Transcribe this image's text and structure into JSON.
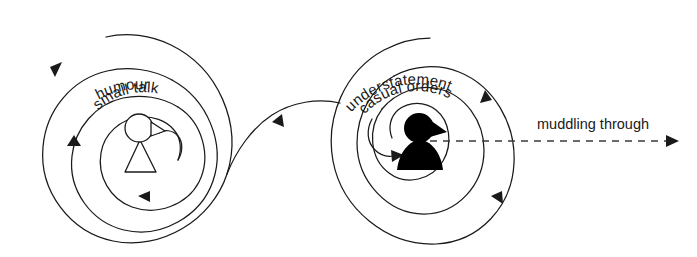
{
  "diagram": {
    "background_color": "#ffffff",
    "stroke_color": "#1a1a1a",
    "dash_color": "#3a3a3a"
  },
  "left_spiral": {
    "name": "left-spiral",
    "direction": "counterclockwise",
    "center_figure": "outlined person icon",
    "labels": [
      {
        "text": "humour",
        "ring": "outer"
      },
      {
        "text": "small talk",
        "ring": "middle"
      }
    ]
  },
  "right_spiral": {
    "name": "right-spiral",
    "direction": "clockwise",
    "center_figure": "filled black person icon",
    "labels": [
      {
        "text": "understatement",
        "ring": "outer"
      },
      {
        "text": "casual orders",
        "ring": "middle"
      }
    ]
  },
  "axis": {
    "label": "muddling through",
    "style": "dashed arrow",
    "direction": "rightward"
  },
  "icons": {
    "left_figure": "person-outline-icon",
    "right_figure": "person-filled-icon",
    "axis_arrow": "arrow-right-icon"
  }
}
